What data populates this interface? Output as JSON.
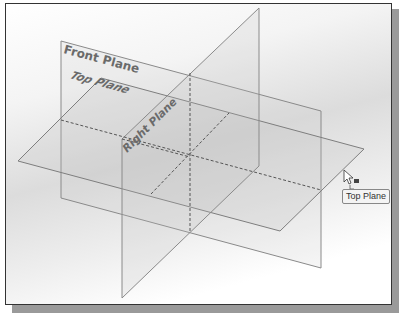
{
  "viewport": {
    "background": "gradient-gray",
    "planes": [
      {
        "name": "Front Plane",
        "label": "Front Plane"
      },
      {
        "name": "Top Plane",
        "label": "Top Plane"
      },
      {
        "name": "Right Plane",
        "label": "Right Plane"
      }
    ]
  },
  "cursor": {
    "icon": "arrow-cursor-with-plane-icon"
  },
  "tooltip": {
    "text": "Top Plane"
  },
  "colors": {
    "plane_edge": "#8a8a8a",
    "label": "#6a6a6a",
    "frame": "#333333",
    "shadow": "#9a9a9a"
  }
}
